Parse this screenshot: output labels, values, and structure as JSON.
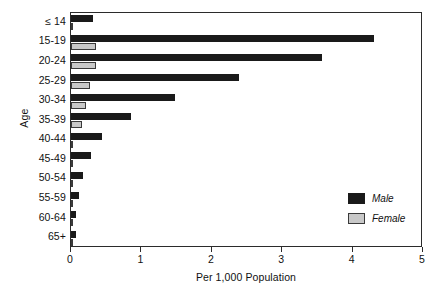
{
  "chart_data": {
    "type": "bar",
    "orientation": "horizontal",
    "title": "",
    "xlabel": "Per 1,000 Population",
    "ylabel": "Age",
    "xlim": [
      0,
      5
    ],
    "xticks": [
      0,
      1,
      2,
      3,
      4,
      5
    ],
    "xtick_labels": [
      "0",
      "1",
      "2",
      "3",
      "4",
      "5"
    ],
    "grid": false,
    "legend_position": "right-inside",
    "categories": [
      "≤ 14",
      "15-19",
      "20-24",
      "25-29",
      "30-34",
      "35-39",
      "40-44",
      "45-49",
      "50-54",
      "55-59",
      "60-64",
      "65+"
    ],
    "series": [
      {
        "name": "Male",
        "color": "#1a1a1a",
        "values": [
          0.31,
          4.31,
          3.57,
          2.38,
          1.48,
          0.85,
          0.44,
          0.28,
          0.17,
          0.12,
          0.07,
          0.07
        ]
      },
      {
        "name": "Female",
        "color": "#c8c8c8",
        "values": [
          0.03,
          0.35,
          0.36,
          0.27,
          0.21,
          0.16,
          0.03,
          0.02,
          0.02,
          0.01,
          0.01,
          0.01
        ]
      }
    ]
  },
  "legend": {
    "entries": [
      {
        "label": "Male",
        "swatch": "male"
      },
      {
        "label": "Female",
        "swatch": "female"
      }
    ]
  },
  "colors": {
    "male": "#1a1a1a",
    "female": "#c8c8c8",
    "axis": "#2b2b2b",
    "background": "#ffffff"
  }
}
